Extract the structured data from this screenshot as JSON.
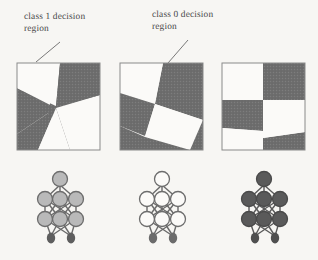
{
  "figure": {
    "background_color": "#f7f6f3",
    "ink_color": "#6e6e6e",
    "line_color": "#5a5a5a",
    "annotations": [
      {
        "id": "class1",
        "text": "class 1 decision\nregion",
        "points_to": "panel-1",
        "leader": {
          "x1": 60,
          "y1": 42,
          "x2": 36,
          "y2": 62
        }
      },
      {
        "id": "class0",
        "text": "class 0 decision\nregion",
        "points_to": "panel-2",
        "leader": {
          "x1": 188,
          "y1": 40,
          "x2": 168,
          "y2": 63
        }
      }
    ],
    "panels": [
      {
        "id": "panel-1",
        "name": "decision-region-panel-1",
        "x": 17,
        "y": 63,
        "width": 83,
        "height": 87,
        "regions_description": "three gray wedges meeting near centre, white triangular class-1 region top-left and centre-right"
      },
      {
        "id": "panel-2",
        "name": "decision-region-panel-2",
        "x": 120,
        "y": 63,
        "width": 83,
        "height": 87,
        "regions_description": "tilted four-quadrant split, gray class-0 bands upper-right and lower-left"
      },
      {
        "id": "panel-3",
        "name": "decision-region-panel-3",
        "x": 222,
        "y": 63,
        "width": 83,
        "height": 87,
        "regions_description": "slightly tilted checkerboard of two gray and two white quadrants"
      }
    ],
    "networks": [
      {
        "id": "net-1",
        "name": "neural-network-diagram-1",
        "cx": 60,
        "cy": 210,
        "node_fill": "#b9b9b9",
        "node_stroke": "#6d6d6d",
        "input_fill": "#5e5e5e",
        "layers": {
          "output": 1,
          "hidden_upper": 3,
          "hidden_lower": 3,
          "input": 2
        }
      },
      {
        "id": "net-2",
        "name": "neural-network-diagram-2",
        "cx": 162,
        "cy": 210,
        "node_fill": "#fbfaf8",
        "node_stroke": "#6d6d6d",
        "input_fill": "#6b6b6b",
        "layers": {
          "output": 1,
          "hidden_upper": 3,
          "hidden_lower": 3,
          "input": 2
        }
      },
      {
        "id": "net-3",
        "name": "neural-network-diagram-3",
        "cx": 264,
        "cy": 210,
        "node_fill": "#5a5a5a",
        "node_stroke": "#4a4a4a",
        "input_fill": "#4f4f4f",
        "layers": {
          "output": 1,
          "hidden_upper": 3,
          "hidden_lower": 3,
          "input": 2
        }
      }
    ]
  }
}
